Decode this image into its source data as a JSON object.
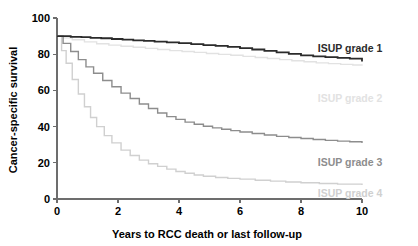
{
  "chart_data": {
    "type": "line",
    "title": "",
    "subtitle": "",
    "xlabel": "Years to RCC death or last follow-up",
    "ylabel": "Cancer-specific survival",
    "xlim": [
      0,
      10
    ],
    "ylim": [
      0,
      100
    ],
    "xticks": [
      0,
      2,
      4,
      6,
      8,
      10
    ],
    "xtick_labels": [
      "0",
      "2",
      "4",
      "6",
      "8",
      "10"
    ],
    "yticks": [
      0,
      20,
      40,
      60,
      80,
      100
    ],
    "ytick_labels": [
      "0",
      "20",
      "40",
      "60",
      "80",
      "100"
    ],
    "grid": false,
    "legend_position": "inline-right",
    "series": [
      {
        "name": "ISUP grade 1",
        "color": "#2b2b2b",
        "label": "ISUP grade 1",
        "label_x": 8.55,
        "label_y": 83.5,
        "x": [
          0,
          0.15,
          0.45,
          0.8,
          1.1,
          1.45,
          1.8,
          2.15,
          2.5,
          2.85,
          3.2,
          3.6,
          4.0,
          4.4,
          4.8,
          5.2,
          5.6,
          6.0,
          6.4,
          6.8,
          7.2,
          7.6,
          8.0,
          8.4,
          8.8,
          9.2,
          9.6,
          10.0
        ],
        "y": [
          90.0,
          90.0,
          89.6,
          89.4,
          89.0,
          88.8,
          88.4,
          88.0,
          87.6,
          87.4,
          87.0,
          86.5,
          86.1,
          85.6,
          85.0,
          84.6,
          84.0,
          83.4,
          82.6,
          81.8,
          81.0,
          80.2,
          79.4,
          78.8,
          78.4,
          78.0,
          77.6,
          76.0
        ]
      },
      {
        "name": "ISUP grade 2",
        "color": "#e2e2e2",
        "label": "ISUP grade 2",
        "label_x": 8.55,
        "label_y": 56.0,
        "x": [
          0,
          0.2,
          0.5,
          0.9,
          1.3,
          1.7,
          2.1,
          2.5,
          2.9,
          3.3,
          3.7,
          4.1,
          4.5,
          4.9,
          5.3,
          5.7,
          6.1,
          6.5,
          6.9,
          7.3,
          7.7,
          8.1,
          8.5,
          8.9,
          9.3,
          9.7,
          10.0
        ],
        "y": [
          90.0,
          89.0,
          88.0,
          86.8,
          85.8,
          85.0,
          84.4,
          83.8,
          83.2,
          82.6,
          82.0,
          81.5,
          81.0,
          80.4,
          79.9,
          79.4,
          78.8,
          78.2,
          77.6,
          77.0,
          76.4,
          75.8,
          75.2,
          74.8,
          74.4,
          74.0,
          73.6
        ]
      },
      {
        "name": "ISUP grade 3",
        "color": "#8d8d8d",
        "label": "ISUP grade 3",
        "label_x": 8.55,
        "label_y": 20.5,
        "x": [
          0,
          0.2,
          0.45,
          0.7,
          0.95,
          1.2,
          1.5,
          1.8,
          2.1,
          2.4,
          2.7,
          3.0,
          3.3,
          3.6,
          3.9,
          4.2,
          4.5,
          4.8,
          5.1,
          5.4,
          5.7,
          6.0,
          6.4,
          6.8,
          7.2,
          7.6,
          8.0,
          8.4,
          8.8,
          9.2,
          9.6,
          10.0
        ],
        "y": [
          90.0,
          86.0,
          81.5,
          77.0,
          73.0,
          69.5,
          65.5,
          62.0,
          58.5,
          55.5,
          52.5,
          50.0,
          47.5,
          45.5,
          44.0,
          42.5,
          41.3,
          40.2,
          39.3,
          38.5,
          37.8,
          37.0,
          36.2,
          35.4,
          34.6,
          34.0,
          33.4,
          32.9,
          32.4,
          32.0,
          31.6,
          31.0
        ]
      },
      {
        "name": "ISUP grade 4",
        "color": "#d0d0d0",
        "label": "ISUP grade 4",
        "label_x": 8.55,
        "label_y": 3.5,
        "x": [
          0,
          0.15,
          0.3,
          0.5,
          0.7,
          0.9,
          1.1,
          1.3,
          1.55,
          1.8,
          2.1,
          2.4,
          2.7,
          3.0,
          3.3,
          3.6,
          3.9,
          4.2,
          4.5,
          4.8,
          5.2,
          5.6,
          6.0,
          6.5,
          7.0,
          7.5,
          8.0,
          8.6,
          9.2,
          10.0
        ],
        "y": [
          90.0,
          82.0,
          75.0,
          66.0,
          58.0,
          51.0,
          45.0,
          40.0,
          35.0,
          31.0,
          27.0,
          24.0,
          21.5,
          19.5,
          18.0,
          16.5,
          15.2,
          14.2,
          13.3,
          12.6,
          11.9,
          11.4,
          11.0,
          10.4,
          9.9,
          9.4,
          9.0,
          8.6,
          8.2,
          7.8
        ]
      }
    ]
  },
  "colors": {
    "axis": "#6d6d6d",
    "text": "#000000",
    "grade1": "#2b2b2b",
    "grade2": "#e2e2e2",
    "grade3": "#8d8d8d",
    "grade4": "#d0d0d0"
  }
}
